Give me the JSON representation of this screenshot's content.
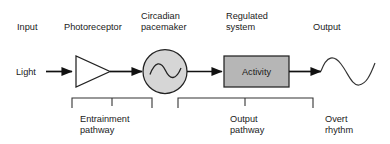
{
  "figure": {
    "background_color": "#ffffff",
    "line_color": "#111111",
    "text_color": "#1a1a1a"
  },
  "top_labels": {
    "input": "Input",
    "photoreceptor": "Photoreceptor",
    "pacemaker_line1": "Circadian",
    "pacemaker_line2": "pacemaker",
    "regulated_line1": "Regulated",
    "regulated_line2": "system",
    "output": "Output"
  },
  "inline_labels": {
    "light": "Light",
    "activity": "Activity"
  },
  "bottom_labels": {
    "entrainment_line1": "Entrainment",
    "entrainment_line2": "pathway",
    "output_line1": "Output",
    "output_line2": "pathway",
    "overt_line1": "Overt",
    "overt_line2": "rhythm"
  },
  "nodes": [
    {
      "id": "photoreceptor",
      "icon": "amplifier-triangle-icon",
      "shape": "triangle",
      "fill": "#ffffff",
      "stroke": "#222222",
      "label": "Photoreceptor"
    },
    {
      "id": "pacemaker",
      "icon": "oscillator-circle-icon",
      "shape": "circle",
      "fill": "#d6d6d6",
      "stroke": "#222222",
      "label": "Circadian pacemaker",
      "inner_icon": "sine-wave-icon"
    },
    {
      "id": "regulated-system",
      "icon": "activity-box-icon",
      "shape": "rectangle",
      "fill": "#b6b6b6",
      "stroke": "#222222",
      "label": "Activity"
    },
    {
      "id": "overt-rhythm",
      "icon": "sine-wave-icon",
      "shape": "wave",
      "fill": "none",
      "stroke": "#333333",
      "label": "Overt rhythm"
    }
  ],
  "connectors": [
    {
      "id": "light-to-photoreceptor",
      "icon": "arrow-right-icon"
    },
    {
      "id": "photoreceptor-to-pacemaker",
      "icon": "arrow-right-icon"
    },
    {
      "id": "pacemaker-to-activity",
      "icon": "arrow-right-icon"
    },
    {
      "id": "activity-to-output",
      "icon": "arrow-right-icon"
    }
  ],
  "brackets": [
    {
      "id": "entrainment-pathway-bracket",
      "icon": "bracket-down-icon",
      "label": "Entrainment pathway"
    },
    {
      "id": "output-pathway-bracket",
      "icon": "bracket-down-icon",
      "label": "Output pathway"
    }
  ]
}
